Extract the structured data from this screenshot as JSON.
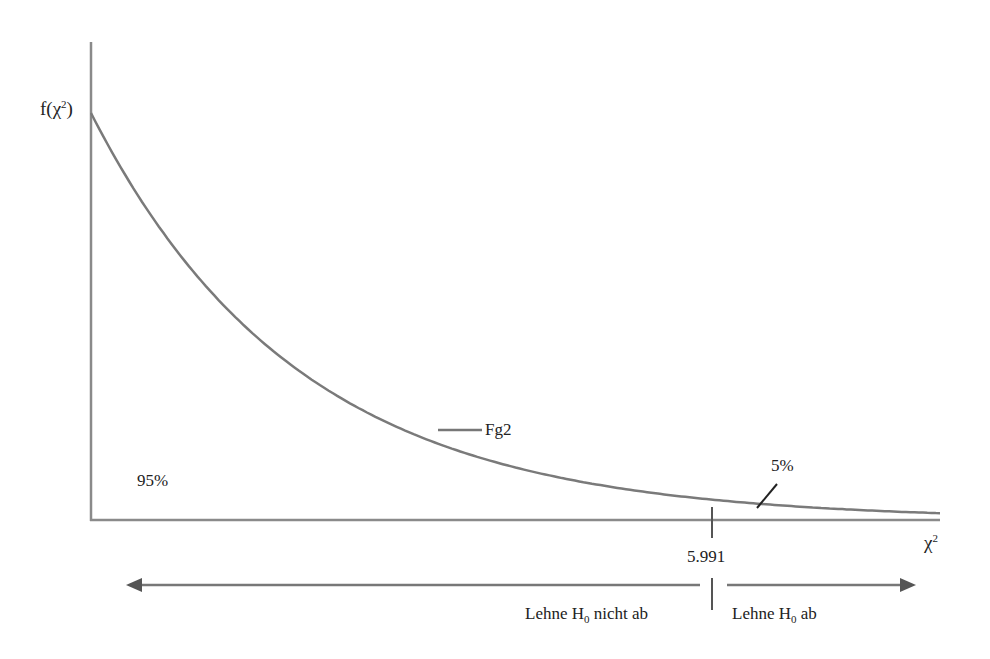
{
  "chart_data": {
    "type": "line",
    "title": "",
    "xlabel": "χ²",
    "ylabel": "f(χ²)",
    "series": [
      {
        "name": "Fg2",
        "function": "chi-square density, 2 degrees of freedom",
        "x": [
          0,
          1,
          2,
          3,
          4,
          5,
          5.991,
          7,
          8
        ],
        "values": [
          0.5,
          0.303,
          0.184,
          0.112,
          0.068,
          0.041,
          0.025,
          0.015,
          0.009
        ]
      }
    ],
    "critical_value": 5.991,
    "areas": [
      {
        "label": "95%",
        "region": "left of critical value"
      },
      {
        "label": "5%",
        "region": "right of critical value"
      }
    ],
    "annotations": [
      "Fg2",
      "95%",
      "5%",
      "5.991"
    ],
    "decision_regions": [
      {
        "label": "Lehne H0 nicht ab",
        "direction": "left"
      },
      {
        "label": "Lehne H0 ab",
        "direction": "right"
      }
    ],
    "xlim": [
      0,
      8.2
    ],
    "ylim": [
      0,
      0.5
    ],
    "grid": false,
    "legend": "inline label"
  },
  "labels": {
    "y_axis_f": "f(χ",
    "y_axis_sup": "2",
    "y_axis_close": ")",
    "x_axis_chi": "χ",
    "x_axis_sup": "2",
    "series_label": "Fg2",
    "left_area": "95%",
    "right_area": "5%",
    "critical_value": "5.991",
    "region_left_prefix": "Lehne H",
    "region_left_sub": "0",
    "region_left_suffix": " nicht ab",
    "region_right_prefix": "Lehne H",
    "region_right_sub": "0",
    "region_right_suffix": " ab"
  },
  "colors": {
    "line": "#777777",
    "text": "#222222",
    "arrow": "#555555"
  }
}
